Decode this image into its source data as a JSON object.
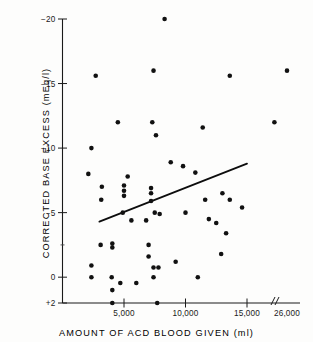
{
  "chart_data": {
    "type": "scatter",
    "title": "",
    "xlabel": "AMOUNT OF ACD BLOOD GIVEN (ml)",
    "ylabel": "CORRECTED BASE EXCESS (mEq/l)",
    "xlim": [
      0,
      26500
    ],
    "ylim": [
      -20,
      2
    ],
    "y_inverted": true,
    "grid": false,
    "legend": null,
    "axis_break": {
      "present": true,
      "label": "//",
      "after_value": 16500
    },
    "xticks": [
      {
        "value": 5000,
        "label": "5,000"
      },
      {
        "value": 10000,
        "label": "10,000"
      },
      {
        "value": 15000,
        "label": "15,000"
      },
      {
        "value": 26000,
        "label": "26,000"
      }
    ],
    "yticks": [
      {
        "value": -20,
        "label": "−20"
      },
      {
        "value": -15,
        "label": "−15"
      },
      {
        "value": -10,
        "label": "−10"
      },
      {
        "value": -5,
        "label": "−5"
      },
      {
        "value": 0,
        "label": "0"
      },
      {
        "value": 2,
        "label": "+2"
      }
    ],
    "y_minor_ticks": [
      -2.5
    ],
    "trend_line": {
      "x": [
        3000,
        15000
      ],
      "y": [
        -4.3,
        -8.8
      ],
      "label": "regression line"
    },
    "points": [
      {
        "x": 8300,
        "y": -20.0
      },
      {
        "x": 7400,
        "y": -16.0
      },
      {
        "x": 2700,
        "y": -15.6
      },
      {
        "x": 13600,
        "y": -15.6
      },
      {
        "x": 26000,
        "y": -16.0
      },
      {
        "x": 4500,
        "y": -12.0
      },
      {
        "x": 7300,
        "y": -12.0
      },
      {
        "x": 11400,
        "y": -11.6
      },
      {
        "x": 23000,
        "y": -12.0
      },
      {
        "x": 7600,
        "y": -11.0
      },
      {
        "x": 2350,
        "y": -10.0
      },
      {
        "x": 8800,
        "y": -8.9
      },
      {
        "x": 9800,
        "y": -8.6
      },
      {
        "x": 10800,
        "y": -8.1
      },
      {
        "x": 2100,
        "y": -8.0
      },
      {
        "x": 5300,
        "y": -7.8
      },
      {
        "x": 3200,
        "y": -7.0
      },
      {
        "x": 5000,
        "y": -7.1
      },
      {
        "x": 5000,
        "y": -6.7
      },
      {
        "x": 7200,
        "y": -6.9
      },
      {
        "x": 7200,
        "y": -6.5
      },
      {
        "x": 3150,
        "y": -6.0
      },
      {
        "x": 5000,
        "y": -6.3
      },
      {
        "x": 7200,
        "y": -5.9
      },
      {
        "x": 11600,
        "y": -6.0
      },
      {
        "x": 13000,
        "y": -6.5
      },
      {
        "x": 13600,
        "y": -6.0
      },
      {
        "x": 4900,
        "y": -5.0
      },
      {
        "x": 7500,
        "y": -5.0
      },
      {
        "x": 10000,
        "y": -5.0
      },
      {
        "x": 7900,
        "y": -4.9
      },
      {
        "x": 14600,
        "y": -5.4
      },
      {
        "x": 11900,
        "y": -4.5
      },
      {
        "x": 12500,
        "y": -4.2
      },
      {
        "x": 5600,
        "y": -4.4
      },
      {
        "x": 6800,
        "y": -4.4
      },
      {
        "x": 13300,
        "y": -3.4
      },
      {
        "x": 3100,
        "y": -2.5
      },
      {
        "x": 4050,
        "y": -2.6
      },
      {
        "x": 4050,
        "y": -2.3
      },
      {
        "x": 7000,
        "y": -2.5
      },
      {
        "x": 7000,
        "y": -1.6
      },
      {
        "x": 12900,
        "y": -1.8
      },
      {
        "x": 2350,
        "y": -0.9
      },
      {
        "x": 7400,
        "y": -0.75
      },
      {
        "x": 7800,
        "y": -0.75
      },
      {
        "x": 9200,
        "y": -1.2
      },
      {
        "x": 2350,
        "y": 0.0
      },
      {
        "x": 4000,
        "y": 0.0
      },
      {
        "x": 4700,
        "y": 0.45
      },
      {
        "x": 6000,
        "y": 0.45
      },
      {
        "x": 7400,
        "y": 0.0
      },
      {
        "x": 11000,
        "y": 0.0
      },
      {
        "x": 4050,
        "y": 1.0
      },
      {
        "x": 4050,
        "y": 2.0
      },
      {
        "x": 7700,
        "y": 2.0
      }
    ]
  },
  "axis_titles": {
    "x": "AMOUNT OF ACD BLOOD GIVEN (ml)",
    "y": "CORRECTED BASE EXCESS (mEq/l)"
  }
}
